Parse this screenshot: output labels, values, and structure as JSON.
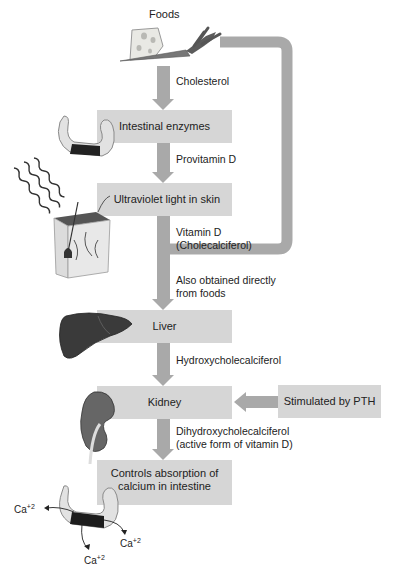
{
  "top_label": "Foods",
  "steps": {
    "intestinal_enzymes": "Intestinal enzymes",
    "ultraviolet": "Ultraviolet light in skin",
    "liver": "Liver",
    "kidney": "Kidney",
    "controls_line1": "Controls absorption of",
    "controls_line2": "calcium in intestine",
    "pth": "Stimulated by PTH"
  },
  "arrow_labels": {
    "cholesterol": "Cholesterol",
    "provitamin": "Provitamin D",
    "vitamin_d_line1": "Vitamin D",
    "vitamin_d_line2": "(Cholecalciferol)",
    "also_line1": "Also obtained directly",
    "also_line2": "from foods",
    "hydroxy": "Hydroxycholecalciferol",
    "dihydroxy_line1": "Dihydroxycholecalciferol",
    "dihydroxy_line2": "(active form of vitamin D)"
  },
  "ions": {
    "symbol": "Ca",
    "charge": "+2"
  },
  "colors": {
    "box": "#d6d6d6",
    "arrow": "#a9a9a9",
    "text": "#222222"
  }
}
